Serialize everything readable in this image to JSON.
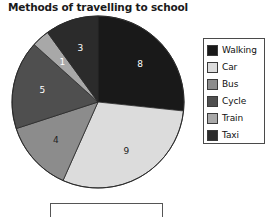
{
  "chart_data": {
    "type": "pie",
    "title": "Methods of travelling to school",
    "categories": [
      "Walking",
      "Car",
      "Bus",
      "Cycle",
      "Train",
      "Taxi"
    ],
    "values": [
      8,
      9,
      4,
      5,
      1,
      3
    ],
    "total": 30,
    "value_labels": [
      "8",
      "9",
      "4",
      "5",
      "1",
      "3"
    ],
    "colors": [
      "#191919",
      "#dcdcdc",
      "#8c8c8c",
      "#4f4f4f",
      "#a8a8a8",
      "#2b2b2b"
    ],
    "label_colors": [
      "#ffffff",
      "#222222",
      "#222222",
      "#ffffff",
      "#ffffff",
      "#ffffff"
    ],
    "start_angle_deg": 0,
    "direction": "clockwise",
    "legend_position": "right",
    "grid": false,
    "xlabel": "",
    "ylabel": ""
  },
  "legend": {
    "items": [
      {
        "label": "Walking",
        "color": "#191919"
      },
      {
        "label": "Car",
        "color": "#dcdcdc"
      },
      {
        "label": "Bus",
        "color": "#8c8c8c"
      },
      {
        "label": "Cycle",
        "color": "#4f4f4f"
      },
      {
        "label": "Train",
        "color": "#a8a8a8"
      },
      {
        "label": "Taxi",
        "color": "#2b2b2b"
      }
    ]
  },
  "answer_box": {
    "value": ""
  }
}
